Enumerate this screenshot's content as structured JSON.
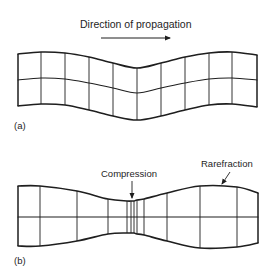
{
  "figure": {
    "stroke_color": "#1e1e1e",
    "background": "#ffffff"
  },
  "panel_a": {
    "label": "(a)",
    "label_pos": [
      14,
      121
    ],
    "title": "Direction of propagation",
    "title_pos": [
      80,
      19
    ],
    "arrow": {
      "x1": 101,
      "y1": 38,
      "x2": 170,
      "y2": 38
    },
    "description": "Transverse wave: grid deformed sinusoidally perpendicular to propagation direction",
    "grid": {
      "columns_x": [
        18,
        41,
        65,
        89,
        113,
        137,
        161,
        185,
        209,
        232,
        257
      ],
      "top_y": [
        54,
        52,
        53,
        57,
        63,
        68,
        63,
        57,
        53,
        52,
        55
      ],
      "mid_y": [
        80,
        78,
        79,
        83,
        88,
        93,
        88,
        83,
        79,
        78,
        80
      ],
      "bottom_y": [
        106,
        104,
        105,
        110,
        116,
        120,
        116,
        110,
        105,
        104,
        107
      ]
    }
  },
  "panel_b": {
    "label": "(b)",
    "label_pos": [
      14,
      256
    ],
    "description": "Longitudinal wave: grid lines compressed and rarefied along propagation direction",
    "grid": {
      "columns_x": [
        18,
        40,
        77,
        108,
        127,
        131,
        134,
        137,
        144,
        167,
        200,
        237,
        258
      ],
      "top_y": [
        186,
        186,
        191,
        199,
        201,
        201,
        201,
        200,
        199,
        193,
        186,
        187,
        193
      ],
      "mid_y": [
        217,
        217,
        217,
        217,
        217,
        217,
        217,
        217,
        217,
        217,
        217,
        217,
        217
      ],
      "bottom_y": [
        246,
        246,
        241,
        234,
        233,
        233,
        233,
        234,
        235,
        241,
        248,
        247,
        243
      ]
    },
    "callouts": [
      {
        "text": "Compression",
        "text_pos": [
          101,
          169
        ],
        "leader": {
          "x1": 132,
          "y1": 181,
          "x2": 132,
          "y2": 198
        },
        "arrowhead": true
      },
      {
        "text": "Rarefraction",
        "text_pos": [
          201,
          159
        ],
        "leader": {
          "x1": 230,
          "y1": 172,
          "x2": 222,
          "y2": 184
        },
        "arrowhead": true
      }
    ]
  }
}
